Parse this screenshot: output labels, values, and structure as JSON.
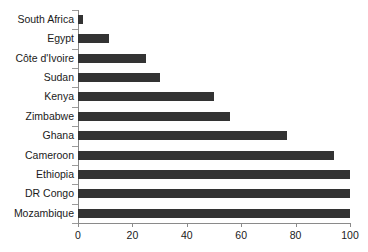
{
  "chart_data": {
    "type": "bar",
    "orientation": "horizontal",
    "title": "",
    "subtitle": "",
    "xlabel": "",
    "ylabel": "",
    "xlim": [
      0,
      100
    ],
    "xticks": [
      0,
      20,
      40,
      60,
      80,
      100
    ],
    "grid": false,
    "legend": false,
    "bar_color": "#333333",
    "axis_color": "#8a8a8a",
    "background": "#ffffff",
    "categories": [
      "South Africa",
      "Egypt",
      "Côte d'Ivoire",
      "Sudan",
      "Kenya",
      "Zimbabwe",
      "Ghana",
      "Cameroon",
      "Ethiopia",
      "DR Congo",
      "Mozambique"
    ],
    "values": [
      2,
      11.5,
      25,
      30,
      50,
      56,
      77,
      94,
      100,
      100,
      100
    ]
  }
}
